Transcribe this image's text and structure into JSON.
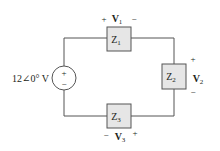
{
  "diagram": {
    "type": "ac-series-circuit",
    "source": {
      "label": "12∠0° V",
      "plus": "+",
      "minus": "−"
    },
    "impedances": [
      {
        "name": "Z",
        "sub": "1"
      },
      {
        "name": "Z",
        "sub": "2"
      },
      {
        "name": "Z",
        "sub": "3"
      }
    ],
    "voltages": [
      {
        "name": "V",
        "sub": "1",
        "plus": "+",
        "minus": "−"
      },
      {
        "name": "V",
        "sub": "2",
        "plus": "+",
        "minus": "−"
      },
      {
        "name": "V",
        "sub": "3",
        "plus": "+",
        "minus": "−"
      }
    ],
    "colors": {
      "wire": "#555555",
      "box_fill": "#e6e6e6",
      "box_stroke": "#555555",
      "text": "#231f20"
    }
  }
}
